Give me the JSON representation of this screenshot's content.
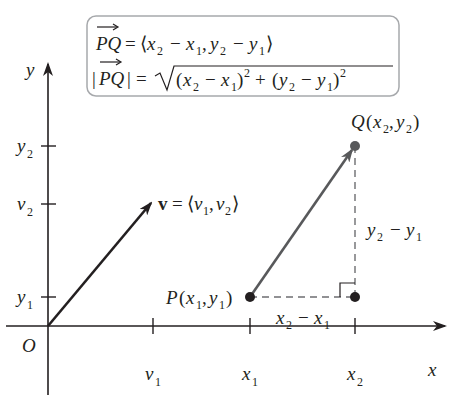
{
  "formula_box": {
    "line1": {
      "lhs": "PQ",
      "rhs": "= ⟨x₂ − x₁, y₂ − y₁⟩"
    },
    "line2": {
      "lhs": "|PQ|",
      "rhs": "= √((x₂ − x₁)² + (y₂ − y₁)²)"
    },
    "border_color": "#a7a9ac"
  },
  "axes": {
    "x_label": "x",
    "y_label": "y",
    "origin_label": "O",
    "x_ticks": [
      "v1",
      "x1",
      "x2"
    ],
    "y_ticks": [
      "y2",
      "v2",
      "y1"
    ]
  },
  "vector_v": {
    "label": "v = ⟨v₁, v₂⟩",
    "color": "#231f20"
  },
  "points": {
    "P": "P(x₁, y₁)",
    "Q": "Q(x₂, y₂)"
  },
  "segment_PQ": {
    "color": "#58595b"
  },
  "differences": {
    "horizontal": "x₂ − x₁",
    "vertical": "y₂ − y₁"
  },
  "colors": {
    "axis": "#231f20",
    "point": "#231f20",
    "point_Q": "#58595b",
    "dashed": "#6d6e71"
  }
}
